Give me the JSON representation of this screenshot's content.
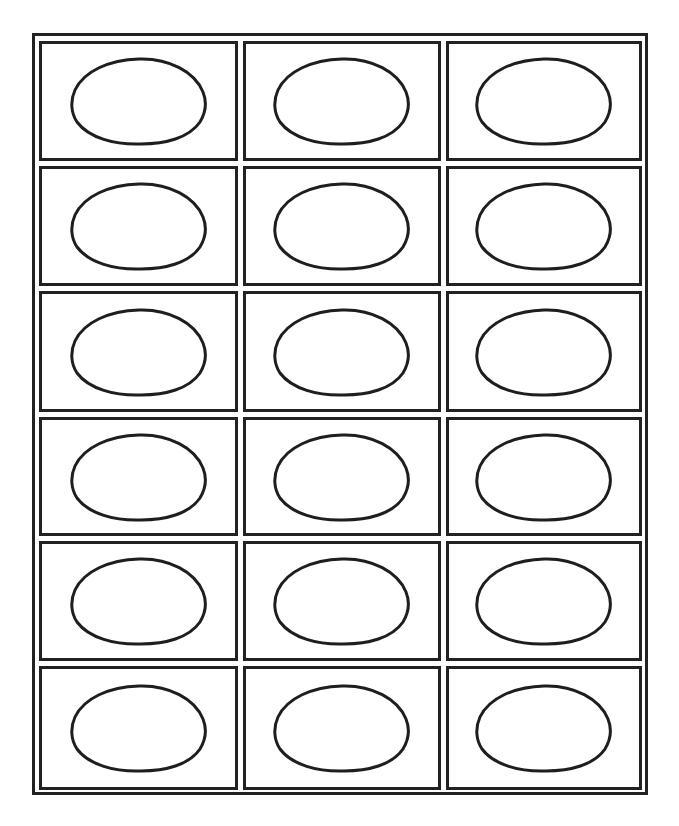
{
  "page": {
    "layout": {
      "columns": 3,
      "rows": 6
    },
    "colors": {
      "border": "#222222",
      "oval_stroke": "#1e1e1e",
      "background": "#ffffff"
    }
  },
  "labels": [
    {
      "row": 1,
      "col": 1,
      "shape": "oval-icon",
      "text": ""
    },
    {
      "row": 1,
      "col": 2,
      "shape": "oval-icon",
      "text": ""
    },
    {
      "row": 1,
      "col": 3,
      "shape": "oval-icon",
      "text": ""
    },
    {
      "row": 2,
      "col": 1,
      "shape": "oval-icon",
      "text": ""
    },
    {
      "row": 2,
      "col": 2,
      "shape": "oval-icon",
      "text": ""
    },
    {
      "row": 2,
      "col": 3,
      "shape": "oval-icon",
      "text": ""
    },
    {
      "row": 3,
      "col": 1,
      "shape": "oval-icon",
      "text": ""
    },
    {
      "row": 3,
      "col": 2,
      "shape": "oval-icon",
      "text": ""
    },
    {
      "row": 3,
      "col": 3,
      "shape": "oval-icon",
      "text": ""
    },
    {
      "row": 4,
      "col": 1,
      "shape": "oval-icon",
      "text": ""
    },
    {
      "row": 4,
      "col": 2,
      "shape": "oval-icon",
      "text": ""
    },
    {
      "row": 4,
      "col": 3,
      "shape": "oval-icon",
      "text": ""
    },
    {
      "row": 5,
      "col": 1,
      "shape": "oval-icon",
      "text": ""
    },
    {
      "row": 5,
      "col": 2,
      "shape": "oval-icon",
      "text": ""
    },
    {
      "row": 5,
      "col": 3,
      "shape": "oval-icon",
      "text": ""
    },
    {
      "row": 6,
      "col": 1,
      "shape": "oval-icon",
      "text": ""
    },
    {
      "row": 6,
      "col": 2,
      "shape": "oval-icon",
      "text": ""
    },
    {
      "row": 6,
      "col": 3,
      "shape": "oval-icon",
      "text": ""
    }
  ]
}
